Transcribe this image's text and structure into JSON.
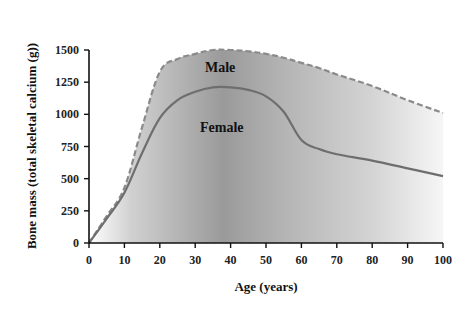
{
  "chart_data": {
    "type": "area",
    "title": "",
    "xlabel": "Age (years)",
    "ylabel": "Bone mass (total skeletal calcium (g))",
    "xlim": [
      0,
      100
    ],
    "ylim": [
      0,
      1500
    ],
    "x_ticks": [
      0,
      10,
      20,
      30,
      40,
      50,
      60,
      70,
      80,
      90,
      100
    ],
    "y_ticks": [
      0,
      250,
      500,
      750,
      1000,
      1250,
      1500
    ],
    "grid": false,
    "legend": "inline labels",
    "x": [
      0,
      5,
      10,
      15,
      20,
      25,
      30,
      35,
      40,
      45,
      50,
      55,
      60,
      65,
      70,
      80,
      90,
      100
    ],
    "series": [
      {
        "name": "Male",
        "style": "dashed",
        "color": "#8a8a8a",
        "values": [
          0,
          210,
          430,
          900,
          1330,
          1430,
          1470,
          1500,
          1500,
          1490,
          1470,
          1440,
          1400,
          1360,
          1310,
          1220,
          1110,
          1010
        ]
      },
      {
        "name": "Female",
        "style": "solid",
        "color": "#6e6e6e",
        "values": [
          0,
          190,
          390,
          700,
          970,
          1110,
          1175,
          1210,
          1210,
          1190,
          1140,
          1020,
          800,
          730,
          690,
          640,
          580,
          520
        ]
      }
    ],
    "annotations": [
      {
        "text": "Male",
        "x": 38,
        "y": 1400
      },
      {
        "text": "Female",
        "x": 38,
        "y": 860
      }
    ],
    "fill": "grey gradient under male curve, darkest around age 35-40, fading to white at ages 0 and 100"
  },
  "labels": {
    "male": "Male",
    "female": "Female",
    "xlabel": "Age (years)",
    "ylabel": "Bone mass (total skeletal calcium (g))"
  }
}
